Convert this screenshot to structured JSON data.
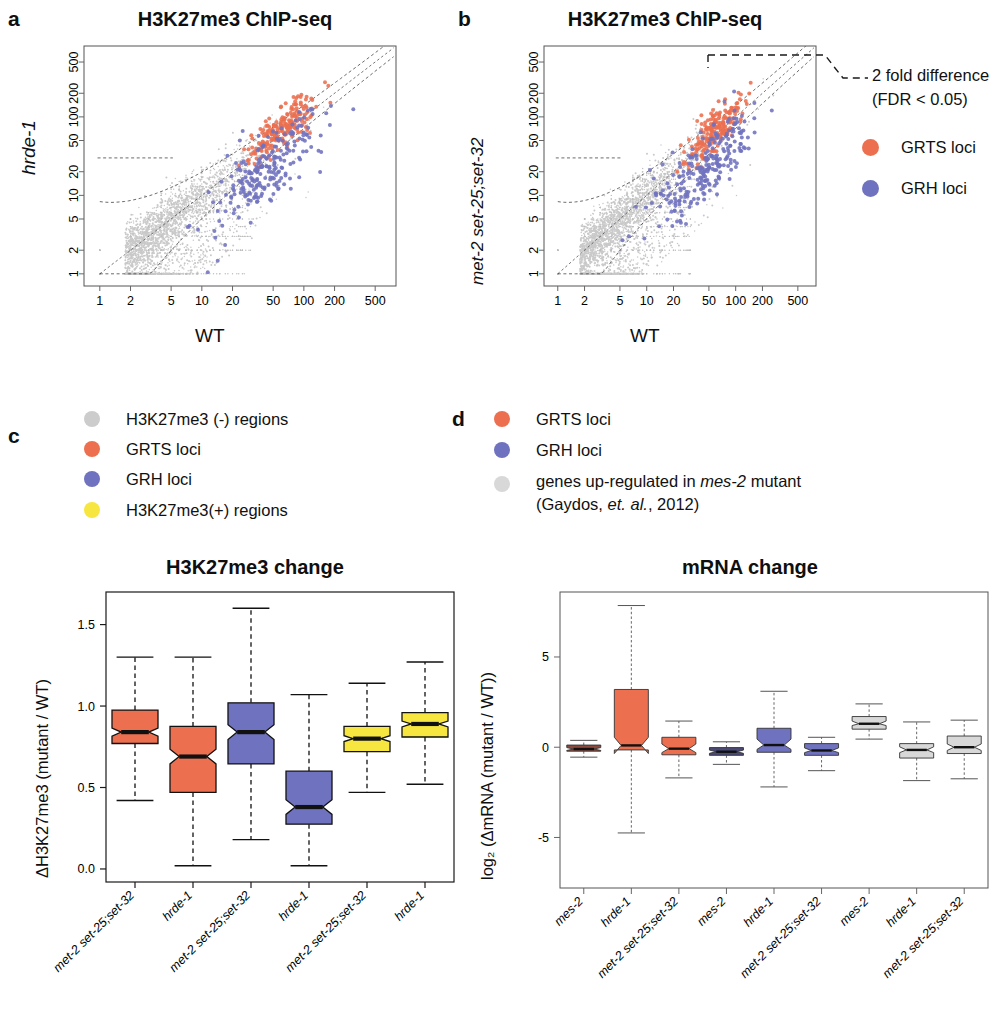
{
  "figure": {
    "panels": [
      "a",
      "b",
      "c",
      "d"
    ]
  },
  "panel_a": {
    "letter": "a",
    "title": "H3K27me3 ChIP-seq",
    "ylabel": "hrde-1",
    "xlabel": "WT"
  },
  "panel_b": {
    "letter": "b",
    "title": "H3K27me3 ChIP-seq",
    "ylabel": "met-2 set-25;set-32",
    "xlabel": "WT",
    "annotation_line1": "2 fold difference",
    "annotation_line2": "(FDR < 0.05)",
    "legend": [
      {
        "label": "GRTS loci",
        "color": "#EC7050"
      },
      {
        "label": "GRH loci",
        "color": "#6F72BE"
      }
    ]
  },
  "panel_c": {
    "letter": "c",
    "legend": [
      {
        "label": "H3K27me3 (-) regions",
        "color": "#CCCCCC"
      },
      {
        "label": "GRTS loci",
        "color": "#EC7050"
      },
      {
        "label": "GRH loci",
        "color": "#6F72BE"
      },
      {
        "label": "H3K27me3(+) regions",
        "color": "#F7E63F"
      }
    ]
  },
  "panel_d": {
    "letter": "d",
    "legend": [
      {
        "label": "GRTS loci",
        "color": "#EC7050",
        "italic_part": ""
      },
      {
        "label": "GRH loci",
        "color": "#6F72BE",
        "italic_part": ""
      },
      {
        "label_pre": "genes up-regulated in ",
        "label_italic": "mes-2",
        "label_post": " mutant",
        "label_line2_pre": "(Gaydos, ",
        "label_line2_italic": "et. al.",
        "label_line2_post": ", 2012)",
        "color": "#D8D8D8"
      }
    ]
  },
  "chart_data": [
    {
      "type": "scatter",
      "panel": "a",
      "title": "H3K27me3 ChIP-seq",
      "xlabel": "WT",
      "ylabel": "hrde-1",
      "xscale": "log",
      "yscale": "log",
      "xticks": [
        1,
        2,
        5,
        10,
        20,
        50,
        100,
        200,
        500
      ],
      "yticks": [
        1,
        2,
        5,
        10,
        20,
        50,
        100,
        200,
        500
      ],
      "xlim": [
        0.7,
        800
      ],
      "ylim": [
        0.7,
        800
      ],
      "grid": false,
      "series": [
        {
          "name": "H3K27me3 (-) regions",
          "color": "#C9C9C9",
          "n_points": 2600
        },
        {
          "name": "GRTS loci",
          "color": "#EC7050",
          "n_points": 210
        },
        {
          "name": "GRH loci",
          "color": "#6F72BE",
          "n_points": 230
        }
      ],
      "annotations": [
        "2 fold difference (FDR < 0.05) boundary curves"
      ]
    },
    {
      "type": "scatter",
      "panel": "b",
      "title": "H3K27me3 ChIP-seq",
      "xlabel": "WT",
      "ylabel": "met-2 set-25;set-32",
      "xscale": "log",
      "yscale": "log",
      "xticks": [
        1,
        2,
        5,
        10,
        20,
        50,
        100,
        200,
        500
      ],
      "yticks": [
        1,
        2,
        5,
        10,
        20,
        50,
        100,
        200,
        500
      ],
      "xlim": [
        0.7,
        800
      ],
      "ylim": [
        0.7,
        800
      ],
      "grid": false,
      "series": [
        {
          "name": "H3K27me3 (-) regions",
          "color": "#C9C9C9",
          "n_points": 2600
        },
        {
          "name": "GRTS loci",
          "color": "#EC7050",
          "n_points": 200
        },
        {
          "name": "GRH loci",
          "color": "#6F72BE",
          "n_points": 250
        }
      ],
      "annotations": [
        "2 fold difference",
        "(FDR < 0.05)"
      ]
    },
    {
      "type": "boxplot",
      "panel": "c",
      "title": "H3K27me3 change",
      "ylabel": "ΔH3K27me3 (mutant / WT)",
      "yticks": [
        0.0,
        0.5,
        1.0,
        1.5
      ],
      "ylim": [
        -0.08,
        1.7
      ],
      "grid": false,
      "categories": [
        "met-2 set-25;set-32",
        "hrde-1",
        "met-2 set-25;set-32",
        "hrde-1",
        "met-2 set-25;set-32",
        "hrde-1"
      ],
      "boxes": [
        {
          "group": "GRTS loci",
          "color": "#EC7050",
          "whisker_low": 0.42,
          "q1": 0.77,
          "median": 0.84,
          "q3": 0.975,
          "whisker_high": 1.3,
          "notch_low": 0.815,
          "notch_high": 0.865
        },
        {
          "group": "GRTS loci",
          "color": "#EC7050",
          "whisker_low": 0.02,
          "q1": 0.47,
          "median": 0.69,
          "q3": 0.875,
          "whisker_high": 1.3,
          "notch_low": 0.645,
          "notch_high": 0.735
        },
        {
          "group": "GRH loci",
          "color": "#6F72BE",
          "whisker_low": 0.18,
          "q1": 0.645,
          "median": 0.84,
          "q3": 1.02,
          "whisker_high": 1.6,
          "notch_low": 0.795,
          "notch_high": 0.885
        },
        {
          "group": "GRH loci",
          "color": "#6F72BE",
          "whisker_low": 0.02,
          "q1": 0.275,
          "median": 0.38,
          "q3": 0.6,
          "whisker_high": 1.07,
          "notch_low": 0.335,
          "notch_high": 0.425
        },
        {
          "group": "H3K27me3(+) regions",
          "color": "#F7E63F",
          "whisker_low": 0.47,
          "q1": 0.72,
          "median": 0.8,
          "q3": 0.875,
          "whisker_high": 1.14,
          "notch_low": 0.782,
          "notch_high": 0.818
        },
        {
          "group": "H3K27me3(+) regions",
          "color": "#F7E63F",
          "whisker_low": 0.52,
          "q1": 0.81,
          "median": 0.89,
          "q3": 0.96,
          "whisker_high": 1.27,
          "notch_low": 0.872,
          "notch_high": 0.908
        }
      ]
    },
    {
      "type": "boxplot",
      "panel": "d",
      "title": "mRNA change",
      "ylabel": "log₂ (ΔmRNA (mutant / WT))",
      "yticks": [
        -5,
        0,
        5
      ],
      "ylim": [
        -7.8,
        8.6
      ],
      "grid": false,
      "categories": [
        "mes-2",
        "hrde-1",
        "met-2 set-25;set-32",
        "mes-2",
        "hrde-1",
        "met-2 set-25;set-32",
        "mes-2",
        "hrde-1",
        "met-2 set-25;set-32"
      ],
      "boxes": [
        {
          "group": "GRTS loci",
          "color": "#8B4A3C",
          "whisker_low": -0.55,
          "q1": -0.22,
          "median": -0.1,
          "q3": 0.12,
          "whisker_high": 0.38,
          "notch_low": -0.18,
          "notch_high": -0.02
        },
        {
          "group": "GRTS loci",
          "color": "#EC7050",
          "whisker_low": -4.75,
          "q1": -0.15,
          "median": 0.1,
          "q3": 3.2,
          "whisker_high": 7.85,
          "notch_low": -0.35,
          "notch_high": 0.55
        },
        {
          "group": "GRTS loci",
          "color": "#EC7050",
          "whisker_low": -1.7,
          "q1": -0.42,
          "median": -0.08,
          "q3": 0.55,
          "whisker_high": 1.45,
          "notch_low": -0.3,
          "notch_high": 0.18
        },
        {
          "group": "GRH loci",
          "color": "#4A4A78",
          "whisker_low": -0.95,
          "q1": -0.45,
          "median": -0.25,
          "q3": -0.02,
          "whisker_high": 0.3,
          "notch_low": -0.34,
          "notch_high": -0.16
        },
        {
          "group": "GRH loci",
          "color": "#6F72BE",
          "whisker_low": -2.2,
          "q1": -0.28,
          "median": 0.12,
          "q3": 1.05,
          "whisker_high": 3.1,
          "notch_low": -0.12,
          "notch_high": 0.45
        },
        {
          "group": "GRH loci",
          "color": "#6F72BE",
          "whisker_low": -1.3,
          "q1": -0.45,
          "median": -0.18,
          "q3": 0.2,
          "whisker_high": 0.55,
          "notch_low": -0.3,
          "notch_high": -0.04
        },
        {
          "group": "mes-2 up",
          "color": "#D8D8D8",
          "whisker_low": 0.45,
          "q1": 1.0,
          "median": 1.3,
          "q3": 1.7,
          "whisker_high": 2.4,
          "notch_low": 1.2,
          "notch_high": 1.45
        },
        {
          "group": "mes-2 up",
          "color": "#D8D8D8",
          "whisker_low": -1.85,
          "q1": -0.6,
          "median": -0.15,
          "q3": 0.2,
          "whisker_high": 1.4,
          "notch_low": -0.3,
          "notch_high": 0.02
        },
        {
          "group": "mes-2 up",
          "color": "#D8D8D8",
          "whisker_low": -1.75,
          "q1": -0.35,
          "median": 0.0,
          "q3": 0.62,
          "whisker_high": 1.5,
          "notch_low": -0.18,
          "notch_high": 0.18
        }
      ]
    }
  ]
}
